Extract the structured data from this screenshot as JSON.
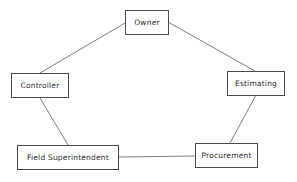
{
  "diagram": {
    "nodes": [
      {
        "id": "owner",
        "label": "Owner"
      },
      {
        "id": "controller",
        "label": "Controller"
      },
      {
        "id": "estimating",
        "label": "Estimating"
      },
      {
        "id": "field_superintendent",
        "label": "Field Superintendent"
      },
      {
        "id": "procurement",
        "label": "Procurement"
      }
    ],
    "edges": [
      {
        "from": "owner",
        "to": "controller"
      },
      {
        "from": "owner",
        "to": "estimating"
      },
      {
        "from": "controller",
        "to": "field_superintendent"
      },
      {
        "from": "estimating",
        "to": "procurement"
      },
      {
        "from": "field_superintendent",
        "to": "procurement"
      }
    ]
  }
}
